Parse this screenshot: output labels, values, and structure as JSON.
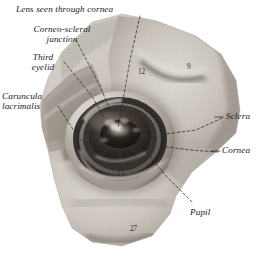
{
  "figure": {
    "kind": "anatomical-photograph",
    "palette": {
      "page_background": "#ffffff",
      "tissue_light": "#d8d4cd",
      "tissue_mid": "#b8b2a9",
      "tissue_shadow": "#8d867d",
      "sclera_pale": "#cfcac2",
      "cornea_ring": "#3a3734",
      "iris_dark": "#26221f",
      "pupil_black": "#100e0d",
      "highlight": "#efece6",
      "ink": "#1c1a18",
      "leader_line": "#2a2724"
    }
  },
  "labels": [
    {
      "id": "lens-seen-through-cornea",
      "text": "Lens seen through cornea"
    },
    {
      "id": "corneo-scleral-junction",
      "text": "Corneo-scleral\njunction"
    },
    {
      "id": "third-eyelid",
      "text": "Third\neyelid"
    },
    {
      "id": "caruncula-lacrimalis",
      "text": "Caruncula\nlacrimalis"
    },
    {
      "id": "sclera",
      "text": "Sclera"
    },
    {
      "id": "cornea",
      "text": "Cornea"
    },
    {
      "id": "pupil",
      "text": "Pupil"
    }
  ],
  "number_labels": [
    {
      "id": "n12",
      "text": "12"
    },
    {
      "id": "n9",
      "text": "9"
    },
    {
      "id": "n13",
      "text": "13"
    },
    {
      "id": "n27",
      "text": "27"
    }
  ]
}
